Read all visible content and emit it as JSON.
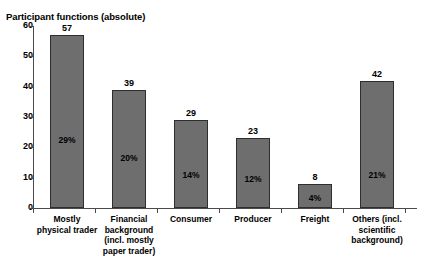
{
  "top_stripe_text": "",
  "chart_data": {
    "type": "bar",
    "title": "Participant functions (absolute)",
    "xlabel": "",
    "ylabel": "",
    "ylim": [
      0,
      60
    ],
    "yticks": [
      0,
      10,
      20,
      30,
      40,
      50,
      60
    ],
    "grid": false,
    "legend": "none",
    "bar_color": "#6e6e6e",
    "bar_edge_color": "#2e2e2e",
    "categories": [
      "Mostly\nphysical trader",
      "Financial\nbackground\n(incl. mostly\npaper trader)",
      "Consumer",
      "Producer",
      "Freight",
      "Others (incl.\nscientific\nbackground)"
    ],
    "values": [
      57,
      39,
      29,
      23,
      8,
      42
    ],
    "data_labels": [
      "57",
      "39",
      "29",
      "23",
      "8",
      "42"
    ],
    "percent_labels": [
      "29%",
      "20%",
      "14%",
      "12%",
      "4%",
      "21%"
    ]
  }
}
